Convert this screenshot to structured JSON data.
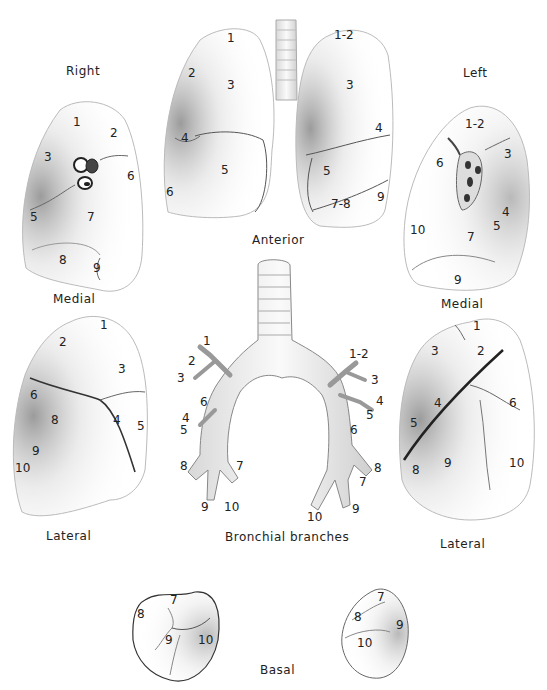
{
  "figure": {
    "views": {
      "right_label": "Right",
      "left_label": "Left",
      "anterior": "Anterior",
      "medial_right": "Medial",
      "medial_left": "Medial",
      "lateral_right": "Lateral",
      "lateral_left": "Lateral",
      "bronchial": "Bronchial branches",
      "basal": "Basal"
    },
    "right_medial": {
      "segments": [
        {
          "id": "1",
          "x": 73,
          "y": 122
        },
        {
          "id": "2",
          "x": 110,
          "y": 133
        },
        {
          "id": "3",
          "x": 44,
          "y": 157
        },
        {
          "id": "6",
          "x": 127,
          "y": 176
        },
        {
          "id": "5",
          "x": 30,
          "y": 217
        },
        {
          "id": "7",
          "x": 87,
          "y": 217
        },
        {
          "id": "8",
          "x": 59,
          "y": 260
        },
        {
          "id": "9",
          "x": 93,
          "y": 268
        }
      ]
    },
    "anterior": {
      "segments": [
        {
          "id": "1",
          "x": 227,
          "y": 38
        },
        {
          "id": "2",
          "x": 188,
          "y": 73
        },
        {
          "id": "3",
          "x": 227,
          "y": 85
        },
        {
          "id": "4",
          "x": 181,
          "y": 138
        },
        {
          "id": "5",
          "x": 221,
          "y": 170
        },
        {
          "id": "6",
          "x": 166,
          "y": 192
        },
        {
          "id": "1-2",
          "x": 334,
          "y": 35
        },
        {
          "id": "3",
          "x": 346,
          "y": 85
        },
        {
          "id": "4",
          "x": 375,
          "y": 128
        },
        {
          "id": "5",
          "x": 323,
          "y": 171
        },
        {
          "id": "7-8",
          "x": 331,
          "y": 204
        },
        {
          "id": "9",
          "x": 377,
          "y": 197
        }
      ]
    },
    "left_medial": {
      "segments": [
        {
          "id": "1-2",
          "x": 465,
          "y": 124
        },
        {
          "id": "3",
          "x": 504,
          "y": 154
        },
        {
          "id": "6",
          "x": 436,
          "y": 163
        },
        {
          "id": "4",
          "x": 502,
          "y": 212
        },
        {
          "id": "5",
          "x": 493,
          "y": 226
        },
        {
          "id": "10",
          "x": 410,
          "y": 230
        },
        {
          "id": "7",
          "x": 467,
          "y": 237
        },
        {
          "id": "9",
          "x": 454,
          "y": 280
        }
      ]
    },
    "right_lateral": {
      "segments": [
        {
          "id": "1",
          "x": 100,
          "y": 325
        },
        {
          "id": "2",
          "x": 59,
          "y": 342
        },
        {
          "id": "3",
          "x": 118,
          "y": 369
        },
        {
          "id": "6",
          "x": 30,
          "y": 395
        },
        {
          "id": "8",
          "x": 51,
          "y": 420
        },
        {
          "id": "4",
          "x": 113,
          "y": 420
        },
        {
          "id": "5",
          "x": 137,
          "y": 426
        },
        {
          "id": "9",
          "x": 32,
          "y": 451
        },
        {
          "id": "10",
          "x": 15,
          "y": 468
        }
      ]
    },
    "bronchial_branches": {
      "right": [
        {
          "id": "1",
          "x": 203,
          "y": 341
        },
        {
          "id": "2",
          "x": 188,
          "y": 361
        },
        {
          "id": "3",
          "x": 177,
          "y": 378
        },
        {
          "id": "6",
          "x": 200,
          "y": 402
        },
        {
          "id": "4",
          "x": 182,
          "y": 418
        },
        {
          "id": "5",
          "x": 180,
          "y": 430
        },
        {
          "id": "8",
          "x": 180,
          "y": 466
        },
        {
          "id": "7",
          "x": 236,
          "y": 466
        },
        {
          "id": "9",
          "x": 201,
          "y": 507
        },
        {
          "id": "10",
          "x": 224,
          "y": 507
        }
      ],
      "left": [
        {
          "id": "1-2",
          "x": 349,
          "y": 354
        },
        {
          "id": "3",
          "x": 371,
          "y": 380
        },
        {
          "id": "4",
          "x": 376,
          "y": 401
        },
        {
          "id": "5",
          "x": 366,
          "y": 415
        },
        {
          "id": "6",
          "x": 350,
          "y": 430
        },
        {
          "id": "8",
          "x": 374,
          "y": 468
        },
        {
          "id": "7",
          "x": 359,
          "y": 482
        },
        {
          "id": "9",
          "x": 352,
          "y": 509
        },
        {
          "id": "10",
          "x": 307,
          "y": 517
        }
      ]
    },
    "left_lateral": {
      "segments": [
        {
          "id": "1",
          "x": 473,
          "y": 326
        },
        {
          "id": "2",
          "x": 477,
          "y": 351
        },
        {
          "id": "3",
          "x": 431,
          "y": 351
        },
        {
          "id": "4",
          "x": 434,
          "y": 403
        },
        {
          "id": "6",
          "x": 509,
          "y": 403
        },
        {
          "id": "5",
          "x": 410,
          "y": 423
        },
        {
          "id": "9",
          "x": 444,
          "y": 463
        },
        {
          "id": "8",
          "x": 412,
          "y": 470
        },
        {
          "id": "10",
          "x": 509,
          "y": 463
        }
      ]
    },
    "basal_right": {
      "segments": [
        {
          "id": "7",
          "x": 170,
          "y": 600
        },
        {
          "id": "8",
          "x": 137,
          "y": 614
        },
        {
          "id": "9",
          "x": 165,
          "y": 640
        },
        {
          "id": "10",
          "x": 198,
          "y": 640
        }
      ]
    },
    "basal_left": {
      "segments": [
        {
          "id": "7",
          "x": 377,
          "y": 597
        },
        {
          "id": "8",
          "x": 354,
          "y": 617
        },
        {
          "id": "9",
          "x": 396,
          "y": 625
        },
        {
          "id": "10",
          "x": 357,
          "y": 643
        }
      ]
    }
  }
}
